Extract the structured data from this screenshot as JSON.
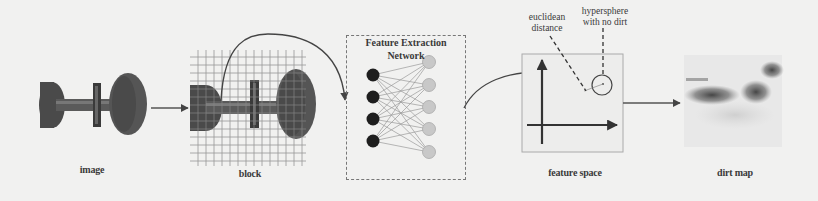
{
  "diagram": {
    "stages": [
      {
        "id": "image",
        "label": "image"
      },
      {
        "id": "block",
        "label": "block"
      },
      {
        "id": "network",
        "label": "Feature Extraction Network",
        "title_lines": [
          "Feature Extraction",
          "Network"
        ]
      },
      {
        "id": "feature_space",
        "label": "feature space"
      },
      {
        "id": "dirt_map",
        "label": "dirt map"
      }
    ],
    "annotations": {
      "euclidean": [
        "euclidean",
        "distance"
      ],
      "hypersphere": [
        "hypersphere",
        "with no dirt"
      ]
    },
    "network": {
      "input_nodes": 4,
      "output_nodes": 5,
      "input_color": "#1e1e1e",
      "output_color": "#c4c4c4"
    },
    "edges": [
      {
        "from": "image",
        "to": "block",
        "style": "straight-arrow"
      },
      {
        "from": "block",
        "to": "network",
        "style": "curved-arrow"
      },
      {
        "from": "network",
        "to": "feature_space",
        "style": "curved-arrow"
      },
      {
        "from": "feature_space",
        "to": "dirt_map",
        "style": "straight-arrow"
      }
    ]
  }
}
